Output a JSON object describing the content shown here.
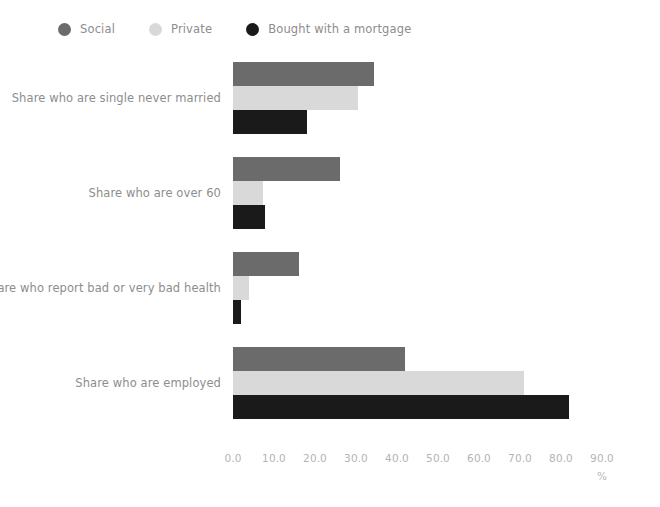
{
  "legend": {
    "position": "top-left",
    "items": [
      {
        "label": "Social",
        "color": "#6b6b6b",
        "icon": "legend-dot-icon"
      },
      {
        "label": "Private",
        "color": "#d9d9d9",
        "icon": "legend-dot-icon"
      },
      {
        "label": "Bought with a mortgage",
        "color": "#1a1a1a",
        "icon": "legend-dot-icon"
      }
    ]
  },
  "chart_data": {
    "type": "bar",
    "orientation": "horizontal",
    "title": "",
    "xlabel": "%",
    "ylabel": "",
    "xlim": [
      0,
      90
    ],
    "grid": false,
    "categories": [
      "Share who are single never married",
      "Share who are over 60",
      "Share who report bad or very bad health",
      "Share who are employed"
    ],
    "series": [
      {
        "name": "Social",
        "color": "#6b6b6b",
        "values": [
          34.5,
          26.0,
          16.0,
          42.0
        ]
      },
      {
        "name": "Private",
        "color": "#d9d9d9",
        "values": [
          30.5,
          7.3,
          4.0,
          71.0
        ]
      },
      {
        "name": "Bought with a mortgage",
        "color": "#1a1a1a",
        "values": [
          18.0,
          7.8,
          2.0,
          82.0
        ]
      }
    ],
    "xticks": [
      "0.0",
      "10.0",
      "20.0",
      "30.0",
      "40.0",
      "50.0",
      "60.0",
      "70.0",
      "80.0",
      "90.0"
    ],
    "xtick_values": [
      0,
      10,
      20,
      30,
      40,
      50,
      60,
      70,
      80,
      90
    ]
  }
}
